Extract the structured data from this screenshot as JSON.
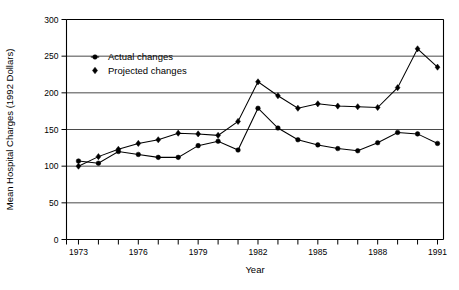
{
  "chart_data": {
    "type": "line",
    "title": "",
    "xlabel": "Year",
    "ylabel": "Mean Hospital Charges (1992 Dollars)",
    "x": [
      1973,
      1974,
      1975,
      1976,
      1977,
      1978,
      1979,
      1980,
      1981,
      1982,
      1983,
      1984,
      1985,
      1986,
      1987,
      1988,
      1989,
      1990,
      1991
    ],
    "xlim": [
      1972.4,
      1991.3
    ],
    "ylim": [
      0,
      300
    ],
    "xticks": [
      1973,
      1974,
      1975,
      1976,
      1977,
      1978,
      1979,
      1980,
      1981,
      1982,
      1983,
      1984,
      1985,
      1986,
      1987,
      1988,
      1989,
      1990,
      1991
    ],
    "xticklabels": [
      "1973",
      "",
      "",
      "1976",
      "",
      "",
      "1979",
      "",
      "",
      "1982",
      "",
      "",
      "1985",
      "",
      "",
      "1988",
      "",
      "",
      "1991"
    ],
    "yticks": [
      0,
      50,
      100,
      150,
      200,
      250,
      300
    ],
    "yticklabels": [
      "0",
      "50",
      "100",
      "150",
      "200",
      "250",
      "300"
    ],
    "grid": "horizontal",
    "legend_position": "upper-left-inside",
    "series": [
      {
        "name": "Actual changes",
        "marker": "circle",
        "values": [
          107,
          104,
          120,
          116,
          112,
          112,
          128,
          134,
          122,
          179,
          152,
          136,
          129,
          124,
          121,
          132,
          146,
          144,
          131
        ]
      },
      {
        "name": "Projected changes",
        "marker": "diamond",
        "values": [
          100,
          113,
          123,
          131,
          136,
          145,
          144,
          142,
          161,
          215,
          196,
          179,
          185,
          182,
          181,
          180,
          207,
          260,
          235
        ]
      }
    ]
  },
  "legend": {
    "items": [
      {
        "label": "Actual changes",
        "marker": "circle"
      },
      {
        "label": "Projected changes",
        "marker": "diamond"
      }
    ]
  },
  "axes": {
    "x_title": "Year",
    "y_title": "Mean Hospital Charges (1992 Dollars)"
  },
  "caption": ""
}
